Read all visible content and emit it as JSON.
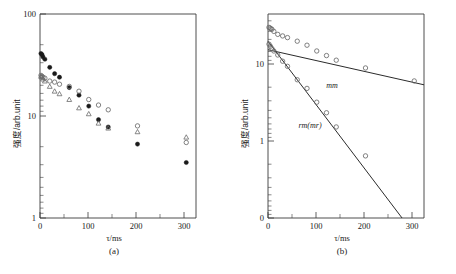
{
  "figure": {
    "panels": [
      {
        "id": "a",
        "caption": "(a)",
        "xlabel": "τ/ms",
        "ylabel": "强度/arb.unit",
        "xticks": [
          "0",
          "100",
          "200",
          "300"
        ],
        "yticks": [
          "1",
          "10",
          "100"
        ]
      },
      {
        "id": "b",
        "caption": "(b)",
        "xlabel": "τ/ms",
        "ylabel": "强度/arb.unit",
        "xticks": [
          "0",
          "100",
          "200",
          "300"
        ],
        "yticks": [
          "0",
          "1",
          "10"
        ],
        "annotations": [
          "mm",
          "rm(mr)"
        ]
      }
    ]
  },
  "chart_data": [
    {
      "type": "scatter",
      "panel": "a",
      "title": "(a)",
      "xlabel": "τ/ms",
      "ylabel": "强度/arb.unit",
      "xscale": "linear",
      "yscale": "log",
      "xlim": [
        0,
        320
      ],
      "ylim": [
        1,
        100
      ],
      "xticks": [
        0,
        100,
        200,
        300
      ],
      "yticks": [
        1,
        10,
        100
      ],
      "grid": false,
      "legend": null,
      "series": [
        {
          "name": "filled-circle",
          "marker": "filled circle",
          "x": [
            2,
            4,
            6,
            10,
            20,
            30,
            40,
            60,
            80,
            100,
            120,
            140,
            200,
            300
          ],
          "y": [
            41,
            40,
            38,
            36,
            30,
            26,
            24,
            19,
            16,
            12.5,
            9.2,
            7.8,
            5.3,
            3.5
          ]
        },
        {
          "name": "open-circle",
          "marker": "open circle",
          "x": [
            2,
            4,
            6,
            10,
            20,
            30,
            40,
            60,
            80,
            100,
            120,
            140,
            200,
            300
          ],
          "y": [
            25,
            24.5,
            24,
            23.5,
            22,
            21.5,
            20.5,
            19.5,
            17.5,
            14.5,
            12.8,
            11.5,
            8.0,
            5.5
          ]
        },
        {
          "name": "open-triangle",
          "marker": "open triangle",
          "x": [
            2,
            4,
            6,
            10,
            20,
            30,
            40,
            60,
            80,
            100,
            120,
            140,
            200,
            300
          ],
          "y": [
            24.5,
            24,
            23,
            22,
            19.5,
            17.5,
            16.5,
            14.5,
            12.0,
            10.5,
            8.5,
            7.6,
            7.0,
            6.2
          ]
        }
      ]
    },
    {
      "type": "scatter",
      "panel": "b",
      "title": "(b)",
      "xlabel": "τ/ms",
      "ylabel": "强度/arb.unit",
      "xscale": "linear",
      "yscale": "log",
      "xlim": [
        0,
        320
      ],
      "ylim": [
        0.1,
        40
      ],
      "xticks": [
        0,
        100,
        200,
        300
      ],
      "yticks": [
        0.1,
        1,
        10
      ],
      "grid": false,
      "legend": null,
      "series": [
        {
          "name": "total-decay",
          "marker": "open circle",
          "x": [
            2,
            4,
            6,
            8,
            12,
            20,
            30,
            40,
            60,
            80,
            100,
            120,
            140,
            200,
            300
          ],
          "y": [
            27,
            26.5,
            26,
            25.5,
            24,
            22,
            21,
            20,
            18,
            16,
            13.5,
            11.8,
            10.3,
            8.2,
            5.6
          ]
        },
        {
          "name": "rm(mr)-component",
          "marker": "open circle",
          "x": [
            2,
            5,
            8,
            12,
            20,
            30,
            40,
            60,
            80,
            100,
            120,
            140,
            200
          ],
          "y": [
            16.5,
            15.5,
            14.5,
            13.5,
            12.0,
            10.0,
            8.6,
            5.8,
            4.5,
            3.0,
            2.2,
            1.45,
            0.62
          ]
        }
      ],
      "fits": [
        {
          "name": "mm",
          "label": "mm",
          "type": "exponential",
          "x": [
            0,
            320
          ],
          "y": [
            14.0,
            5.0
          ]
        },
        {
          "name": "rm(mr)",
          "label": "rm(mr)",
          "type": "exponential",
          "x": [
            0,
            275
          ],
          "y": [
            18.0,
            0.1
          ]
        }
      ]
    }
  ]
}
